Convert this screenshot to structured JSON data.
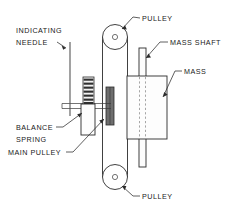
{
  "diagram": {
    "background_color": "#ffffff",
    "line_color": "#2b2b2b",
    "hidden_line_color": "#8f8f8f",
    "main_pulley_color": "#6e6e6e",
    "labels": {
      "indicating_needle_line1": "INDICATING",
      "indicating_needle_line2": "NEEDLE",
      "pulley_top": "PULLEY",
      "pulley_bottom": "PULLEY",
      "mass_shaft": "MASS SHAFT",
      "mass": "MASS",
      "balance_spring_line1": "BALANCE",
      "balance_spring_line2": "SPRING",
      "main_pulley": "MAIN PULLEY"
    },
    "components": [
      {
        "name": "pulley-top",
        "kind": "pulley",
        "cx": 115,
        "cy": 37,
        "r": 12.5,
        "hub_r": 2.6
      },
      {
        "name": "pulley-bottom",
        "kind": "pulley",
        "cx": 115,
        "cy": 177,
        "r": 12.5,
        "hub_r": 2.6
      },
      {
        "name": "mass-block",
        "kind": "rect",
        "x": 127,
        "y": 76,
        "w": 40,
        "h": 63
      },
      {
        "name": "mass-shaft-upper",
        "kind": "rect",
        "x": 139,
        "y": 48,
        "w": 7,
        "h": 28
      },
      {
        "name": "mass-shaft-lower",
        "kind": "rect",
        "x": 139,
        "y": 139,
        "w": 7,
        "h": 28
      },
      {
        "name": "main-pulley",
        "kind": "rect",
        "x": 106,
        "y": 87,
        "w": 8,
        "h": 38
      },
      {
        "name": "balance-spring-coil",
        "kind": "coil",
        "x": 83,
        "y": 77,
        "w": 11,
        "h": 28,
        "bands": 6
      },
      {
        "name": "balance-spring-body",
        "kind": "rect",
        "x": 81,
        "y": 105,
        "w": 14,
        "h": 30
      },
      {
        "name": "indicating-needle",
        "kind": "line",
        "x1": 70,
        "y1": 42,
        "x2": 70,
        "y2": 116
      },
      {
        "name": "horizontal-shaft",
        "kind": "shaft",
        "x1": 62,
        "y1": 103,
        "x2": 112,
        "y2": 109
      }
    ]
  }
}
